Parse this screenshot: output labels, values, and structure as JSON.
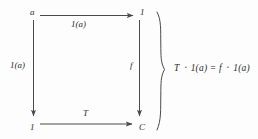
{
  "diagram": {
    "type": "commutative-square",
    "stroke_color": "#4a4a4a",
    "text_color": "#2b2b2b",
    "background_color": "#fdfdfd",
    "nodes": [
      {
        "id": "top-left",
        "label": "a",
        "x": 31,
        "y": 10
      },
      {
        "id": "top-right",
        "label": "1",
        "x": 141,
        "y": 10
      },
      {
        "id": "bottom-left",
        "label": "1",
        "x": 31,
        "y": 126
      },
      {
        "id": "bottom-right",
        "label": "C",
        "x": 140,
        "y": 126
      }
    ],
    "edges": [
      {
        "id": "top",
        "label": "1(a)",
        "from": "top-left",
        "to": "top-right",
        "label_x": 72,
        "label_y": 21
      },
      {
        "id": "left",
        "label": "1(a)",
        "from": "top-left",
        "to": "bottom-left",
        "label_x": 11,
        "label_y": 62
      },
      {
        "id": "right",
        "label": "f",
        "from": "top-right",
        "to": "bottom-right",
        "label_x": 131,
        "label_y": 62
      },
      {
        "id": "bottom",
        "label": "T",
        "from": "bottom-left",
        "to": "bottom-right",
        "label_x": 84,
        "label_y": 110
      }
    ],
    "brace": {
      "id": "right-brace",
      "orientation": "right-facing",
      "top_y": 12,
      "bottom_y": 130,
      "point_y": 70,
      "x": 160
    },
    "equation": {
      "text": "T ᛫ 1(a) = f ᛫ 1(a)",
      "x": 174,
      "y": 65
    }
  }
}
